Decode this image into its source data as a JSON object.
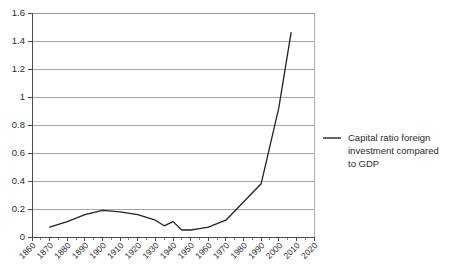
{
  "chart_data": {
    "type": "line",
    "title": "",
    "xlabel": "",
    "ylabel": "",
    "xlim": [
      1860,
      2020
    ],
    "ylim": [
      0,
      1.6
    ],
    "grid": true,
    "legend_position": "right",
    "y_ticks": [
      "0",
      "0.2",
      "0.4",
      "0.6",
      "0.8",
      "1",
      "1.2",
      "1.4",
      "1.6"
    ],
    "y_tick_values": [
      0,
      0.2,
      0.4,
      0.6,
      0.8,
      1.0,
      1.2,
      1.4,
      1.6
    ],
    "x_ticks": [
      "1860",
      "1870",
      "1880",
      "1890",
      "1900",
      "1910",
      "1920",
      "1930",
      "1940",
      "1950",
      "1960",
      "1970",
      "1980",
      "1990",
      "2000",
      "2010",
      "2020"
    ],
    "x_tick_values": [
      1860,
      1870,
      1880,
      1890,
      1900,
      1910,
      1920,
      1930,
      1940,
      1950,
      1960,
      1970,
      1980,
      1990,
      2000,
      2010,
      2020
    ],
    "series": [
      {
        "name": "Capital ratio foreign investment compared to GDP",
        "color": "#222222",
        "x": [
          1870,
          1880,
          1890,
          1900,
          1910,
          1920,
          1930,
          1935,
          1940,
          1945,
          1950,
          1955,
          1960,
          1970,
          1980,
          1990,
          2000,
          2007
        ],
        "values": [
          0.07,
          0.11,
          0.16,
          0.19,
          0.18,
          0.16,
          0.12,
          0.08,
          0.11,
          0.05,
          0.05,
          0.06,
          0.07,
          0.12,
          0.25,
          0.38,
          0.92,
          1.46
        ]
      }
    ]
  },
  "legend": {
    "entries": [
      {
        "label": "Capital ratio foreign investment compared to GDP",
        "line1": "Capital ratio foreign",
        "line2": "investment compared",
        "line3": "to GDP",
        "color": "#222222"
      }
    ]
  },
  "colors": {
    "series": "#222222",
    "grid": "#8d8d8d",
    "axis": "#4a4a4a",
    "background": "#ffffff",
    "text": "#2b2b2b"
  }
}
